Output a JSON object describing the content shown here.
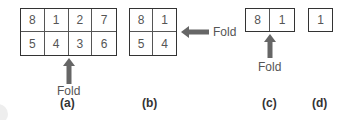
{
  "panels": {
    "a": {
      "caption": "(a)",
      "rows": [
        [
          "8",
          "1",
          "2",
          "7"
        ],
        [
          "5",
          "4",
          "3",
          "6"
        ]
      ],
      "fold_label": "Fold",
      "fold_direction": "up"
    },
    "b": {
      "caption": "(b)",
      "rows": [
        [
          "8",
          "1"
        ],
        [
          "5",
          "4"
        ]
      ],
      "fold_label": "Fold",
      "fold_direction": "left"
    },
    "c": {
      "caption": "(c)",
      "rows": [
        [
          "8",
          "1"
        ]
      ],
      "fold_label": "Fold",
      "fold_direction": "up"
    },
    "d": {
      "caption": "(d)",
      "rows": [
        [
          "1"
        ]
      ]
    }
  },
  "colors": {
    "arrow": "#666666",
    "border": "#333333"
  }
}
